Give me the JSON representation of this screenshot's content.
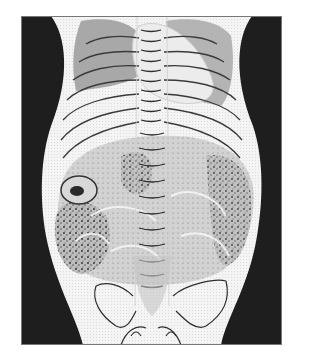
{
  "figure": {
    "type": "medical-illustration",
    "colors": {
      "background": "#ffffff",
      "frame_dark": "#1e1e1e",
      "torso": "#f2f2f2",
      "shadow_gray": "#a8a8a8",
      "heart": "#ececec",
      "bowel": "#c9c9c9",
      "speckle": "#2a2a2a",
      "line": "#3a3a3a"
    }
  }
}
